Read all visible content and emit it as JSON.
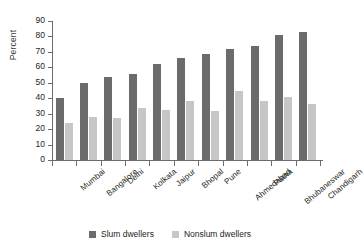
{
  "chart_data": {
    "type": "bar",
    "title": "",
    "subtitle": "",
    "xlabel": "",
    "ylabel": "Percent",
    "ylim": [
      0,
      90
    ],
    "ytick_step": 10,
    "yticks": [
      0,
      10,
      20,
      30,
      40,
      50,
      60,
      70,
      80,
      90
    ],
    "grid": false,
    "legend_position": "bottom-center",
    "orientation": "vertical",
    "categories": [
      "Mumbai",
      "Bangalore",
      "Delhi",
      "Kolkata",
      "Jaipur",
      "Bhopal",
      "Pune",
      "Ahmedabad",
      "Patna",
      "Bhubaneswar",
      "Chandigarh"
    ],
    "series": [
      {
        "name": "Slum dwellers",
        "color": "#6b6b6b",
        "values": [
          40,
          50,
          54,
          56,
          62,
          66,
          68.5,
          72,
          74,
          81,
          83
        ]
      },
      {
        "name": "Nonslum dwellers",
        "color": "#c6c6c6",
        "values": [
          24,
          28,
          27,
          33.5,
          32.5,
          38.5,
          31.5,
          44.5,
          38.5,
          40.5,
          36.5
        ]
      }
    ],
    "annotations": []
  },
  "legend": {
    "items": [
      {
        "label": "Slum dwellers",
        "color": "#6b6b6b"
      },
      {
        "label": "Nonslum dwellers",
        "color": "#c6c6c6"
      }
    ]
  },
  "colors": {
    "slum": "#6b6b6b",
    "nonslum": "#c6c6c6",
    "axis": "#6d6d6d",
    "text": "#231f20",
    "background": "#ffffff"
  }
}
